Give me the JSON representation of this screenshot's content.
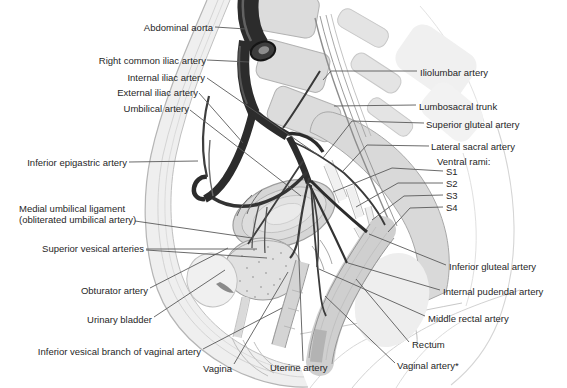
{
  "figure": {
    "palette": {
      "background": "#ffffff",
      "artery_dark": "#2c2c2c",
      "bone_gray": "#d9d9d9",
      "organ_gray": "#d6d6d6",
      "leader_line": "#5a5a5a",
      "text": "#1f1f1f"
    }
  },
  "labels": {
    "abdominal_aorta": "Abdominal aorta",
    "right_common_iliac_artery": "Right common iliac artery",
    "internal_iliac_artery": "Internal iliac artery",
    "external_iliac_artery": "External iliac artery",
    "umbilical_artery": "Umbilical artery",
    "inferior_epigastric_artery": "Inferior epigastric artery",
    "medial_umbilical_ligament": "Medial umbilical ligament\n(obliterated umbilical artery)",
    "superior_vesical_arteries": "Superior vesical arteries",
    "obturator_artery": "Obturator artery",
    "urinary_bladder": "Urinary bladder",
    "inferior_vesical_branch": "Inferior vesical branch of vaginal artery",
    "vagina": "Vagina",
    "uterine_artery": "Uterine artery",
    "iliolumbar_artery": "Iliolumbar artery",
    "lumbosacral_trunk": "Lumbosacral trunk",
    "superior_gluteal_artery": "Superior gluteal artery",
    "lateral_sacral_artery": "Lateral sacral artery",
    "ventral_rami": "Ventral rami:",
    "s1": "S1",
    "s2": "S2",
    "s3": "S3",
    "s4": "S4",
    "inferior_gluteal_artery": "Inferior gluteal artery",
    "internal_pudendal_artery": "Internal pudendal artery",
    "middle_rectal_artery": "Middle rectal artery",
    "rectum": "Rectum",
    "vaginal_artery": "Vaginal artery*"
  }
}
